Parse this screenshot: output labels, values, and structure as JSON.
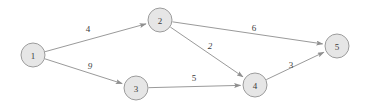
{
  "diagram": {
    "type": "directed-weighted-graph",
    "title": "",
    "background_color": "#ffffff",
    "node_fill_color": "#e6e6e6",
    "node_stroke_color": "#9c9c9c",
    "edge_color": "#9a9a9a",
    "label_color": "#3b3b3b",
    "node_radius": 12,
    "nodes": [
      {
        "id": "1",
        "label": "1",
        "cx": 33,
        "cy": 55
      },
      {
        "id": "2",
        "label": "2",
        "cx": 160,
        "cy": 20
      },
      {
        "id": "3",
        "label": "3",
        "cx": 136,
        "cy": 88
      },
      {
        "id": "4",
        "label": "4",
        "cx": 255,
        "cy": 85
      },
      {
        "id": "5",
        "label": "5",
        "cx": 337,
        "cy": 46
      }
    ],
    "edges": [
      {
        "from": "1",
        "to": "2",
        "weight": "4",
        "label_x": 88,
        "label_y": 29,
        "italic": false
      },
      {
        "from": "1",
        "to": "3",
        "weight": "9",
        "label_x": 90,
        "label_y": 66,
        "italic": true
      },
      {
        "from": "2",
        "to": "5",
        "weight": "6",
        "label_x": 254,
        "label_y": 28,
        "italic": false
      },
      {
        "from": "2",
        "to": "4",
        "weight": "2",
        "label_x": 210,
        "label_y": 46,
        "italic": true
      },
      {
        "from": "3",
        "to": "4",
        "weight": "5",
        "label_x": 194,
        "label_y": 78,
        "italic": false
      },
      {
        "from": "4",
        "to": "5",
        "weight": "3",
        "label_x": 291,
        "label_y": 65,
        "italic": false
      }
    ]
  }
}
